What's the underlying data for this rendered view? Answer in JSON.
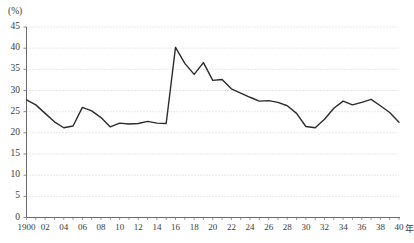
{
  "chart_data": {
    "type": "line",
    "title": "",
    "subtitle": "",
    "xlabel": "年",
    "ylabel": "(%)",
    "unit_label": "(%)",
    "x_unit_suffix": "年",
    "xlim": [
      1900,
      1940
    ],
    "ylim": [
      0,
      45
    ],
    "y_ticks": [
      0,
      5,
      10,
      15,
      20,
      25,
      30,
      35,
      40,
      45
    ],
    "y_tick_labels": [
      "0",
      "5",
      "10",
      "15",
      "20",
      "25",
      "30",
      "35",
      "40",
      "45"
    ],
    "x_ticks": [
      1900,
      1902,
      1904,
      1906,
      1908,
      1910,
      1912,
      1914,
      1916,
      1918,
      1920,
      1922,
      1924,
      1926,
      1928,
      1930,
      1932,
      1934,
      1936,
      1938,
      1940
    ],
    "x_tick_labels": [
      "1900",
      "02",
      "04",
      "06",
      "08",
      "10",
      "12",
      "14",
      "16",
      "18",
      "20",
      "22",
      "24",
      "26",
      "28",
      "30",
      "32",
      "34",
      "36",
      "38",
      "40"
    ],
    "x_minor_step": 1,
    "grid": "horizontal-dotted",
    "legend": "none",
    "line_color": "#2b2b2b",
    "grid_color": "#bfbfbf",
    "axis_color": "#6b6b6b",
    "x": [
      1900,
      1901,
      1902,
      1903,
      1904,
      1905,
      1906,
      1907,
      1908,
      1909,
      1910,
      1911,
      1912,
      1913,
      1914,
      1915,
      1916,
      1917,
      1918,
      1919,
      1920,
      1921,
      1922,
      1923,
      1924,
      1925,
      1926,
      1927,
      1928,
      1929,
      1930,
      1931,
      1932,
      1933,
      1934,
      1935,
      1936,
      1937,
      1938,
      1939,
      1940
    ],
    "values": [
      27.8,
      26.6,
      24.6,
      22.6,
      21.2,
      21.6,
      26.0,
      25.2,
      23.6,
      21.4,
      22.3,
      22.1,
      22.2,
      22.7,
      22.3,
      22.2,
      40.2,
      36.4,
      33.8,
      36.6,
      32.4,
      32.6,
      30.4,
      29.4,
      28.4,
      27.5,
      27.6,
      27.2,
      26.4,
      24.6,
      21.5,
      21.2,
      23.2,
      25.8,
      27.5,
      26.6,
      27.2,
      27.9,
      26.4,
      24.8,
      22.5
    ]
  }
}
